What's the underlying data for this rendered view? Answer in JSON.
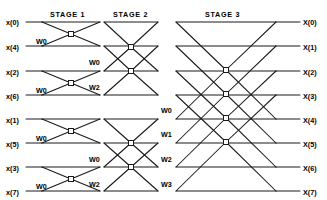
{
  "figure": {
    "kind": "fft-butterfly-signal-flow-graph",
    "size": 8,
    "line_color": "#1a1a1a",
    "background_color": "#ffffff",
    "node_fill_color": "#ffffff"
  },
  "stages": [
    {
      "id": "stage-1",
      "label": "STAGE 1",
      "x": 50,
      "y": 10
    },
    {
      "id": "stage-2",
      "label": "STAGE 2",
      "x": 113,
      "y": 10
    },
    {
      "id": "stage-3",
      "label": "STAGE 3",
      "x": 205,
      "y": 10
    }
  ],
  "inputs": [
    {
      "label": "x(0)",
      "x": 6,
      "y": 18
    },
    {
      "label": "x(4)",
      "x": 6,
      "y": 43
    },
    {
      "label": "x(2)",
      "x": 6,
      "y": 68
    },
    {
      "label": "x(6)",
      "x": 6,
      "y": 92
    },
    {
      "label": "x(1)",
      "x": 6,
      "y": 116
    },
    {
      "label": "x(5)",
      "x": 6,
      "y": 140
    },
    {
      "label": "x(3)",
      "x": 6,
      "y": 164
    },
    {
      "label": "x(7)",
      "x": 6,
      "y": 188
    }
  ],
  "outputs": [
    {
      "label": "X(0)",
      "x": 303,
      "y": 18
    },
    {
      "label": "X(1)",
      "x": 303,
      "y": 43
    },
    {
      "label": "X(2)",
      "x": 303,
      "y": 68
    },
    {
      "label": "X(3)",
      "x": 303,
      "y": 92
    },
    {
      "label": "X(4)",
      "x": 303,
      "y": 116
    },
    {
      "label": "X(5)",
      "x": 303,
      "y": 140
    },
    {
      "label": "X(6)",
      "x": 303,
      "y": 164
    },
    {
      "label": "X(7)",
      "x": 303,
      "y": 188
    }
  ],
  "twiddles": [
    {
      "label": "W0",
      "stage": 1,
      "x": 36,
      "y": 37
    },
    {
      "label": "W0",
      "stage": 1,
      "x": 36,
      "y": 86
    },
    {
      "label": "W0",
      "stage": 1,
      "x": 36,
      "y": 134
    },
    {
      "label": "W0",
      "stage": 1,
      "x": 36,
      "y": 182
    },
    {
      "label": "W0",
      "stage": 2,
      "x": 89,
      "y": 58
    },
    {
      "label": "W2",
      "stage": 2,
      "x": 89,
      "y": 83
    },
    {
      "label": "W0",
      "stage": 2,
      "x": 89,
      "y": 155
    },
    {
      "label": "W2",
      "stage": 2,
      "x": 89,
      "y": 180
    },
    {
      "label": "W0",
      "stage": 3,
      "x": 161,
      "y": 106
    },
    {
      "label": "W1",
      "stage": 3,
      "x": 161,
      "y": 130
    },
    {
      "label": "W2",
      "stage": 3,
      "x": 161,
      "y": 155
    },
    {
      "label": "W3",
      "stage": 3,
      "x": 161,
      "y": 180
    }
  ],
  "geometry": {
    "rows_y": [
      22,
      46,
      71,
      95,
      119,
      143,
      167,
      191
    ],
    "input_line_start_x": 26,
    "output_line_end_x": 300,
    "stage1": {
      "fan_start_x": 42,
      "node_x": 71,
      "fan_end_x": 100,
      "nodes_y": [
        34,
        83,
        131,
        179
      ],
      "pairs": [
        [
          0,
          1
        ],
        [
          2,
          3
        ],
        [
          4,
          5
        ],
        [
          6,
          7
        ]
      ]
    },
    "stage2": {
      "fan_start_x": 104,
      "node_x": 131,
      "fan_end_x": 158,
      "nodes_y": [
        47,
        71,
        143,
        167
      ],
      "pairs": [
        [
          0,
          2
        ],
        [
          1,
          3
        ],
        [
          4,
          6
        ],
        [
          5,
          7
        ]
      ]
    },
    "stage3": {
      "fan_start_x": 176,
      "node_x": 226,
      "fan_end_x": 276,
      "nodes_y": [
        70,
        94,
        118,
        142
      ],
      "pairs": [
        [
          0,
          4
        ],
        [
          1,
          5
        ],
        [
          2,
          6
        ],
        [
          3,
          7
        ]
      ]
    },
    "node_box": 5
  }
}
